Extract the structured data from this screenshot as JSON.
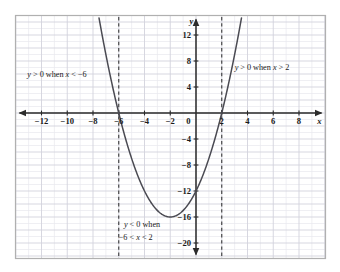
{
  "figure": {
    "background_color": "#ffffff",
    "frame_color": "#b0b0b0",
    "grid_minor_color": "#e8e8ee",
    "grid_major_color": "#d2d2dc",
    "axis_color": "#2b2b2b",
    "curve_color": "#4a4a52",
    "dash_color": "#3a3a3a"
  },
  "chart_data": {
    "type": "line",
    "title": "",
    "subtitle": "",
    "xlabel": "x",
    "ylabel": "y",
    "xlim": [
      -14,
      10
    ],
    "ylim": [
      -22,
      14
    ],
    "grid": true,
    "grid_step": 1,
    "legend": "none",
    "x_ticks": [
      -12,
      -10,
      -8,
      -6,
      -4,
      -2,
      0,
      2,
      4,
      6,
      8
    ],
    "x_tick_labels": [
      "−12",
      "−10",
      "−8",
      "−6",
      "−4",
      "−2",
      "0",
      "2",
      "4",
      "6",
      "8"
    ],
    "y_ticks": [
      12,
      8,
      4,
      -4,
      -8,
      -12,
      -16,
      -20
    ],
    "y_tick_labels": [
      "12",
      "8",
      "4",
      "−4",
      "−8",
      "−12",
      "−16",
      "−20"
    ],
    "series": [
      {
        "name": "y = x^2 + 4x - 12",
        "equation": "y = (x + 6)(x - 2)",
        "type": "parabola",
        "a": 1,
        "b": 4,
        "c": -12,
        "vertex": [
          -2,
          -16
        ],
        "roots": [
          -6,
          2
        ],
        "y_intercept": -12,
        "x": [
          -8.2,
          -8,
          -7.5,
          -7,
          -6.5,
          -6,
          -5.5,
          -5,
          -4.5,
          -4,
          -3.5,
          -3,
          -2.5,
          -2,
          -1.5,
          -1,
          -0.5,
          0,
          0.5,
          1,
          1.5,
          2,
          2.5,
          3,
          3.5,
          4,
          4.2
        ],
        "values": [
          20.84,
          20,
          14.25,
          9,
          4.25,
          0,
          -3.75,
          -7,
          -9.75,
          -12,
          -13.75,
          -15,
          -15.75,
          -16,
          -15.75,
          -15,
          -13.75,
          -12,
          -9.75,
          -7,
          -3.75,
          0,
          4.25,
          9,
          14.25,
          20,
          22.24
        ]
      }
    ],
    "vertical_markers": [
      {
        "name": "root-left-dashed",
        "x": -6,
        "style": "dashed"
      },
      {
        "name": "root-right-dashed",
        "x": 2,
        "style": "dashed"
      }
    ],
    "annotations": [
      {
        "id": "left",
        "text": "y > 0 when x < −6",
        "parts": [
          {
            "t": "y",
            "italic": true
          },
          {
            "t": " > 0 when ",
            "italic": false
          },
          {
            "t": "x",
            "italic": true
          },
          {
            "t": " < −6",
            "italic": false
          }
        ],
        "x": -13.1,
        "y": 5.6
      },
      {
        "id": "right",
        "text": "y > 0 when x > 2",
        "parts": [
          {
            "t": "y",
            "italic": true
          },
          {
            "t": " > 0 when ",
            "italic": false
          },
          {
            "t": "x",
            "italic": true
          },
          {
            "t": " > 2",
            "italic": false
          }
        ],
        "x": 3.0,
        "y": 6.6
      },
      {
        "id": "bottom-line1",
        "text": "y < 0 when",
        "parts": [
          {
            "t": "y",
            "italic": true
          },
          {
            "t": " < 0 when",
            "italic": false
          }
        ],
        "x": -5.6,
        "y": -17.6
      },
      {
        "id": "bottom-line2",
        "text": "−6 < x < 2",
        "parts": [
          {
            "t": "−6 < ",
            "italic": false
          },
          {
            "t": "x",
            "italic": true
          },
          {
            "t": " < 2",
            "italic": false
          }
        ],
        "x": -6.0,
        "y": -19.6
      }
    ]
  }
}
